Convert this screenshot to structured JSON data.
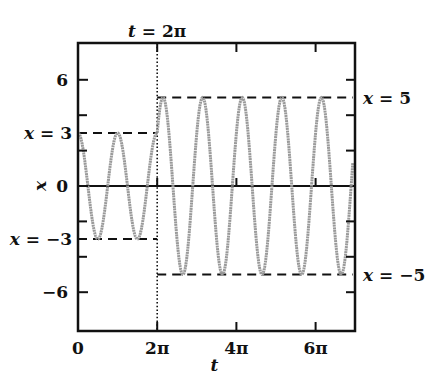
{
  "chart_data": {
    "type": "line",
    "title": "",
    "xlabel": "t",
    "ylabel": "x",
    "xlim": [
      0,
      6.94
    ],
    "xlim_units": "pi",
    "ylim": [
      -8,
      8.7
    ],
    "grid": false,
    "legend": null,
    "x_ticks": [
      {
        "value_pi": 0,
        "label": "0"
      },
      {
        "value_pi": 2,
        "label": "2π"
      },
      {
        "value_pi": 4,
        "label": "4π"
      },
      {
        "value_pi": 6,
        "label": "6π"
      }
    ],
    "y_ticks": [
      {
        "value": 6,
        "label": "6"
      },
      {
        "value": 0,
        "label": "0"
      },
      {
        "value": -6,
        "label": "−6"
      }
    ],
    "y_minor_ticks": [
      4,
      2,
      -2,
      -4
    ],
    "series": [
      {
        "name": "x(t) for 0 ≤ t < 2π",
        "formula": "x = 3 cos(2t)",
        "amplitude": 3,
        "angular_frequency": 2,
        "phase": 0,
        "t_start_pi": 0,
        "t_end_pi": 2,
        "color": "#9a9a9a"
      },
      {
        "name": "x(t) for t ≥ 2π",
        "formula": "x = 5 cos(2t − 0.927)",
        "amplitude": 5,
        "angular_frequency": 2,
        "phase": 0.927,
        "t_start_pi": 2,
        "t_end_pi": 6.94,
        "color": "#9a9a9a"
      }
    ],
    "reference_lines": [
      {
        "type": "hline",
        "y": 3,
        "t_from_pi": 0,
        "t_to_pi": 2,
        "style": "dashed",
        "label": "x = 3",
        "label_side": "left"
      },
      {
        "type": "hline",
        "y": -3,
        "t_from_pi": 0,
        "t_to_pi": 2,
        "style": "dashed",
        "label": "x = −3",
        "label_side": "left"
      },
      {
        "type": "hline",
        "y": 5,
        "t_from_pi": 2,
        "t_to_pi": 6.94,
        "style": "dashed",
        "label": "x = 5",
        "label_side": "right"
      },
      {
        "type": "hline",
        "y": -5,
        "t_from_pi": 2,
        "t_to_pi": 6.94,
        "style": "dashed",
        "label": "x = −5",
        "label_side": "right"
      },
      {
        "type": "hline",
        "y": 0,
        "style": "solid",
        "label": ""
      },
      {
        "type": "vline",
        "t_pi": 2,
        "style": "dotted",
        "label": "t = 2π",
        "label_side": "top"
      }
    ]
  }
}
